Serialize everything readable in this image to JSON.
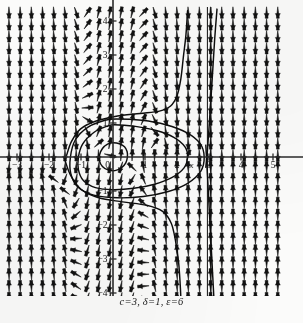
{
  "figure": {
    "title": "",
    "caption": "c=3, δ=1, ε=6"
  },
  "chart_data": {
    "type": "scatter",
    "plot_kind": "vector-field-phase-portrait",
    "title": "",
    "subtitle": "",
    "caption": "c=3, δ=1, ε=6",
    "xlabel": "x",
    "ylabel": "y",
    "xlim": [
      -3.4,
      5.4
    ],
    "ylim": [
      -4.4,
      4.4
    ],
    "xticks": [
      -3,
      -2,
      -1,
      0,
      1,
      2,
      3,
      4,
      5
    ],
    "xticklabels": [
      "−3",
      "−2",
      "−1",
      "0",
      "1",
      "2",
      "3",
      "4",
      "5"
    ],
    "yticks": [
      -4,
      -3,
      -2,
      -1,
      0,
      1,
      2,
      3,
      4
    ],
    "yticklabels": [
      "−4",
      "−3",
      "−2",
      "−1",
      "0",
      "1",
      "2",
      "3",
      "4"
    ],
    "grid": false,
    "legend": null,
    "axis_label_positions": {
      "x": {
        "x": 2.45,
        "y": -0.32
      },
      "y": {
        "x": -0.38,
        "y": 2.05
      }
    },
    "parameters": [
      {
        "symbol": "c",
        "value": 3
      },
      {
        "symbol": "δ",
        "value": 1
      },
      {
        "symbol": "ε",
        "value": 6
      }
    ],
    "field": {
      "description": "direction field arrows on a regular lattice",
      "x_samples": [
        -3.25,
        -2.9,
        -2.55,
        -2.2,
        -1.85,
        -1.5,
        -1.15,
        -0.8,
        -0.45,
        -0.1,
        0.25,
        0.6,
        0.95,
        1.3,
        1.65,
        2.0,
        2.35,
        2.7,
        3.05,
        3.4,
        3.75,
        4.1,
        4.45,
        4.8,
        5.15
      ],
      "y_samples": [
        4.25,
        3.9,
        3.55,
        3.2,
        2.85,
        2.5,
        2.15,
        1.8,
        1.45,
        1.1,
        0.75,
        0.4,
        0.05,
        -0.3,
        -0.65,
        -1.0,
        -1.35,
        -1.7,
        -2.05,
        -2.4,
        -2.75,
        -3.1,
        -3.45,
        -3.8,
        -4.15
      ],
      "u_expr": "y",
      "v_expr": "-eps*y*(x*x - 1) - x*(x - c)/delta",
      "singular_line_x": 3.0,
      "arrow_color": "#121212"
    },
    "trajectories": [
      {
        "name": "inner-closed-orbit",
        "closed": true,
        "kind": "periodic-orbit",
        "points": [
          [
            0.0,
            0.42
          ],
          [
            0.2,
            0.39
          ],
          [
            0.36,
            0.3
          ],
          [
            0.44,
            0.16
          ],
          [
            0.45,
            0.0
          ],
          [
            0.4,
            -0.17
          ],
          [
            0.26,
            -0.32
          ],
          [
            0.06,
            -0.4
          ],
          [
            -0.16,
            -0.38
          ],
          [
            -0.33,
            -0.28
          ],
          [
            -0.42,
            -0.12
          ],
          [
            -0.42,
            0.06
          ],
          [
            -0.33,
            0.25
          ],
          [
            -0.17,
            0.38
          ],
          [
            0.0,
            0.42
          ]
        ]
      },
      {
        "name": "middle-closed-orbit",
        "closed": true,
        "kind": "periodic-orbit",
        "points": [
          [
            0.05,
            0.95
          ],
          [
            0.7,
            0.9
          ],
          [
            1.35,
            0.78
          ],
          [
            1.9,
            0.58
          ],
          [
            2.25,
            0.3
          ],
          [
            2.33,
            0.0
          ],
          [
            2.22,
            -0.32
          ],
          [
            1.85,
            -0.6
          ],
          [
            1.3,
            -0.8
          ],
          [
            0.65,
            -0.92
          ],
          [
            0.0,
            -0.96
          ],
          [
            -0.55,
            -0.9
          ],
          [
            -0.92,
            -0.7
          ],
          [
            -1.08,
            -0.38
          ],
          [
            -1.08,
            0.0
          ],
          [
            -0.95,
            0.38
          ],
          [
            -0.6,
            0.72
          ],
          [
            -0.2,
            0.9
          ],
          [
            0.05,
            0.95
          ]
        ]
      },
      {
        "name": "outer-closed-orbit",
        "closed": true,
        "kind": "periodic-orbit",
        "points": [
          [
            0.1,
            1.12
          ],
          [
            0.9,
            1.08
          ],
          [
            1.65,
            0.95
          ],
          [
            2.3,
            0.72
          ],
          [
            2.72,
            0.4
          ],
          [
            2.85,
            0.0
          ],
          [
            2.74,
            -0.42
          ],
          [
            2.32,
            -0.78
          ],
          [
            1.7,
            -1.02
          ],
          [
            0.95,
            -1.16
          ],
          [
            0.15,
            -1.2
          ],
          [
            -0.6,
            -1.12
          ],
          [
            -1.1,
            -0.88
          ],
          [
            -1.32,
            -0.48
          ],
          [
            -1.33,
            0.0
          ],
          [
            -1.18,
            0.5
          ],
          [
            -0.78,
            0.88
          ],
          [
            -0.25,
            1.08
          ],
          [
            0.1,
            1.12
          ]
        ]
      },
      {
        "name": "upper-separatrix",
        "closed": false,
        "kind": "separatrix",
        "points": [
          [
            -1.45,
            0.05
          ],
          [
            -1.3,
            0.45
          ],
          [
            -1.02,
            0.82
          ],
          [
            -0.55,
            1.05
          ],
          [
            0.1,
            1.2
          ],
          [
            0.85,
            1.28
          ],
          [
            1.45,
            1.35
          ],
          [
            1.8,
            1.5
          ],
          [
            2.0,
            1.8
          ],
          [
            2.12,
            2.3
          ],
          [
            2.2,
            2.95
          ],
          [
            2.28,
            3.6
          ],
          [
            2.33,
            4.3
          ]
        ]
      },
      {
        "name": "lower-separatrix",
        "closed": false,
        "kind": "separatrix",
        "points": [
          [
            -1.5,
            -0.1
          ],
          [
            -1.32,
            -0.55
          ],
          [
            -1.0,
            -0.95
          ],
          [
            -0.45,
            -1.2
          ],
          [
            0.3,
            -1.32
          ],
          [
            1.05,
            -1.42
          ],
          [
            1.55,
            -1.6
          ],
          [
            1.82,
            -1.95
          ],
          [
            1.96,
            -2.5
          ],
          [
            2.05,
            -3.1
          ],
          [
            2.1,
            -3.75
          ],
          [
            2.13,
            -4.35
          ]
        ]
      },
      {
        "name": "right-incoming-upper",
        "closed": false,
        "kind": "separatrix",
        "points": [
          [
            3.25,
            4.35
          ],
          [
            3.18,
            3.5
          ],
          [
            3.12,
            2.6
          ],
          [
            3.06,
            1.7
          ],
          [
            3.0,
            0.85
          ],
          [
            2.95,
            0.18
          ],
          [
            2.9,
            -0.3
          ]
        ]
      },
      {
        "name": "right-incoming-lower",
        "closed": false,
        "kind": "separatrix",
        "points": [
          [
            2.9,
            0.35
          ],
          [
            2.95,
            -0.5
          ],
          [
            3.0,
            -1.4
          ],
          [
            3.05,
            -2.3
          ],
          [
            3.1,
            -3.2
          ],
          [
            3.15,
            -4.1
          ],
          [
            3.17,
            -4.4
          ]
        ]
      },
      {
        "name": "vertical-asymptote-left",
        "closed": false,
        "kind": "asymptote",
        "points": [
          [
            2.95,
            4.4
          ],
          [
            2.95,
            -4.4
          ]
        ]
      },
      {
        "name": "vertical-asymptote-right",
        "closed": false,
        "kind": "asymptote",
        "points": [
          [
            3.06,
            4.4
          ],
          [
            3.06,
            -4.4
          ]
        ]
      }
    ],
    "equilibria": [
      {
        "x": 0,
        "y": 0,
        "type": "center"
      },
      {
        "x": 3,
        "y": 0,
        "type": "saddle"
      }
    ]
  }
}
